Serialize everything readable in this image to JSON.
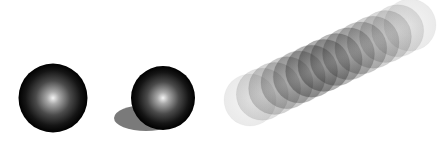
{
  "scene": {
    "background": "#ffffff",
    "objects": [
      {
        "name": "sphere-plain",
        "cx": 53,
        "cy": 98,
        "r": 34.5
      },
      {
        "name": "sphere-with-shadow",
        "cx": 163,
        "cy": 98,
        "r": 32,
        "shadow": {
          "cx": 146,
          "cy": 118,
          "rx": 32,
          "ry": 13,
          "color": "#7a7a7a"
        }
      },
      {
        "name": "motion-blur-streak",
        "from": [
          250,
          100
        ],
        "to": [
          410,
          25
        ],
        "r": 26,
        "copies": 14
      }
    ]
  }
}
